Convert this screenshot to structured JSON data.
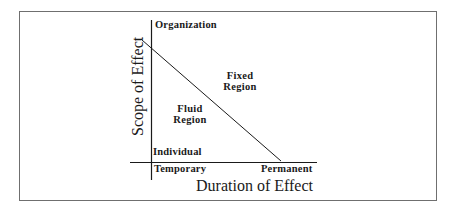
{
  "diagram": {
    "axes": {
      "y": {
        "title": "Scope of Effect",
        "top_label": "Organization",
        "bottom_label": "Individual"
      },
      "x": {
        "title": "Duration of Effect",
        "left_label": "Temporary",
        "right_label": "Permanent"
      }
    },
    "regions": {
      "fixed": {
        "line1": "Fixed",
        "line2": "Region"
      },
      "fluid": {
        "line1": "Fluid",
        "line2": "Region"
      }
    },
    "colors": {
      "line": "#1a1a1a",
      "frame": "#6f6f6f",
      "background": "#ffffff"
    }
  }
}
